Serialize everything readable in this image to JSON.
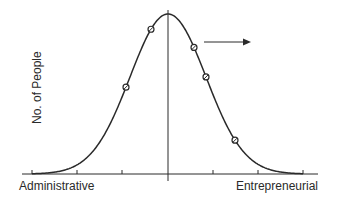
{
  "diagram": {
    "title": "",
    "type": "bell-curve",
    "y_axis_label": "No. of People",
    "x_axis_left_label": "Administrative",
    "x_axis_right_label": "Entrepreneurial",
    "colors": {
      "line": "#2a2a2a",
      "background": "#ffffff"
    },
    "markers": [
      {
        "name": "marker-left-lower"
      },
      {
        "name": "marker-left-upper"
      },
      {
        "name": "marker-right-upper"
      },
      {
        "name": "marker-right-middle"
      },
      {
        "name": "marker-right-lower"
      }
    ],
    "annotation_arrow": {
      "direction": "right"
    }
  }
}
